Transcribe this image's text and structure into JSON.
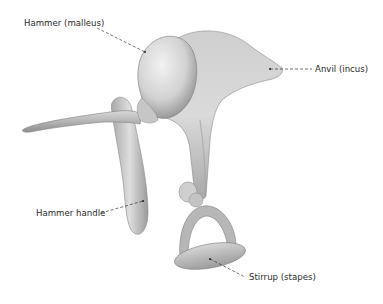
{
  "diagram": {
    "labels": [
      {
        "id": "hammer",
        "text": "Hammer (malleus)"
      },
      {
        "id": "anvil",
        "text": "Anvil (incus)"
      },
      {
        "id": "hammer_handle",
        "text": "Hammer handle"
      },
      {
        "id": "stirrup",
        "text": "Stirrup (stapes)"
      }
    ]
  },
  "colors": {
    "background": "#ffffff",
    "bone_light": "#e6e6e6",
    "bone_mid": "#bdbdbd",
    "bone_dark": "#7d7d7d",
    "label_text": "#2b2b2b",
    "leader_line": "#333333"
  }
}
